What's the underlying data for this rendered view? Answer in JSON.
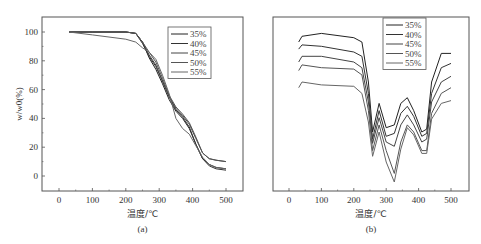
{
  "chart_data": [
    {
      "id": "a",
      "type": "line",
      "caption": "(a)",
      "xlabel": "温度/℃",
      "ylabel": "w/w0(%)",
      "xlim": [
        -40,
        550
      ],
      "ylim": [
        -10,
        110
      ],
      "xticks": [
        0,
        100,
        200,
        300,
        400,
        500
      ],
      "yticks": [
        0,
        20,
        40,
        60,
        80,
        100
      ],
      "legend": {
        "position": "upper right",
        "entries": [
          "35%",
          "40%",
          "45%",
          "50%",
          "55%"
        ]
      },
      "series": [
        {
          "name": "35%",
          "x": [
            30,
            100,
            200,
            230,
            250,
            270,
            290,
            310,
            330,
            350,
            370,
            390,
            410,
            430,
            450,
            470,
            500
          ],
          "y": [
            100,
            100,
            100,
            99,
            93,
            82,
            74,
            64,
            53,
            45,
            40,
            33,
            22,
            12,
            8,
            6,
            5
          ]
        },
        {
          "name": "40%",
          "x": [
            30,
            100,
            200,
            230,
            250,
            270,
            290,
            310,
            330,
            350,
            370,
            390,
            410,
            430,
            450,
            470,
            500
          ],
          "y": [
            100,
            100,
            100,
            99,
            92,
            83,
            76,
            66,
            55,
            46,
            41,
            34,
            22,
            12,
            7,
            5,
            4
          ]
        },
        {
          "name": "45%",
          "x": [
            30,
            100,
            200,
            230,
            250,
            270,
            290,
            310,
            330,
            350,
            370,
            390,
            410,
            430,
            450,
            470,
            500
          ],
          "y": [
            100,
            100,
            100,
            99,
            93,
            84,
            77,
            66,
            55,
            47,
            42,
            36,
            26,
            16,
            12,
            11,
            10
          ]
        },
        {
          "name": "50%",
          "x": [
            30,
            100,
            200,
            230,
            250,
            270,
            290,
            310,
            330,
            350,
            370,
            390,
            410,
            430,
            450,
            470,
            500
          ],
          "y": [
            100,
            100,
            100,
            99,
            93,
            86,
            79,
            68,
            56,
            48,
            43,
            37,
            27,
            16,
            12,
            11,
            10
          ]
        },
        {
          "name": "55%",
          "x": [
            30,
            100,
            200,
            230,
            250,
            270,
            290,
            310,
            330,
            350,
            370,
            390,
            410,
            430,
            450,
            470,
            500
          ],
          "y": [
            100,
            98,
            95,
            93,
            89,
            86,
            81,
            70,
            57,
            40,
            33,
            29,
            21,
            13,
            8,
            6,
            5
          ]
        }
      ]
    },
    {
      "id": "b",
      "type": "line",
      "caption": "(b)",
      "xlabel": "温度/℃",
      "ylabel": "",
      "xlim": [
        -40,
        550
      ],
      "xticks": [
        0,
        100,
        200,
        300,
        400,
        500
      ],
      "yticks": [],
      "legend": {
        "position": "upper right",
        "entries": [
          "35%",
          "40%",
          "45%",
          "50%",
          "55%"
        ]
      },
      "series": [
        {
          "name": "35%",
          "x": [
            30,
            40,
            100,
            200,
            225,
            245,
            258,
            278,
            300,
            325,
            345,
            365,
            385,
            410,
            425,
            440,
            470,
            500
          ],
          "y": [
            98,
            102,
            104,
            101,
            98,
            70,
            35,
            55,
            38,
            40,
            55,
            59,
            50,
            35,
            37,
            70,
            90,
            90
          ]
        },
        {
          "name": "40%",
          "x": [
            30,
            40,
            100,
            200,
            225,
            245,
            258,
            278,
            300,
            325,
            345,
            365,
            385,
            410,
            425,
            440,
            470,
            500
          ],
          "y": [
            93,
            96,
            95,
            91,
            88,
            62,
            30,
            50,
            32,
            34,
            48,
            53,
            46,
            32,
            34,
            62,
            80,
            83
          ]
        },
        {
          "name": "45%",
          "x": [
            30,
            40,
            100,
            200,
            225,
            245,
            258,
            278,
            300,
            325,
            345,
            365,
            385,
            410,
            425,
            440,
            470,
            500
          ],
          "y": [
            84,
            88,
            88,
            84,
            80,
            56,
            27,
            45,
            28,
            25,
            40,
            47,
            40,
            28,
            30,
            56,
            70,
            74
          ]
        },
        {
          "name": "50%",
          "x": [
            30,
            40,
            100,
            200,
            225,
            245,
            258,
            278,
            300,
            325,
            345,
            365,
            385,
            410,
            425,
            440,
            470,
            500
          ],
          "y": [
            78,
            82,
            80,
            79,
            75,
            50,
            22,
            40,
            22,
            6,
            28,
            40,
            35,
            22,
            22,
            48,
            62,
            66
          ]
        },
        {
          "name": "55%",
          "x": [
            30,
            40,
            100,
            200,
            225,
            245,
            258,
            278,
            300,
            325,
            345,
            365,
            385,
            410,
            425,
            440,
            470,
            500
          ],
          "y": [
            66,
            70,
            68,
            67,
            62,
            42,
            18,
            35,
            14,
            0,
            23,
            38,
            33,
            20,
            20,
            44,
            55,
            57
          ]
        }
      ]
    }
  ]
}
